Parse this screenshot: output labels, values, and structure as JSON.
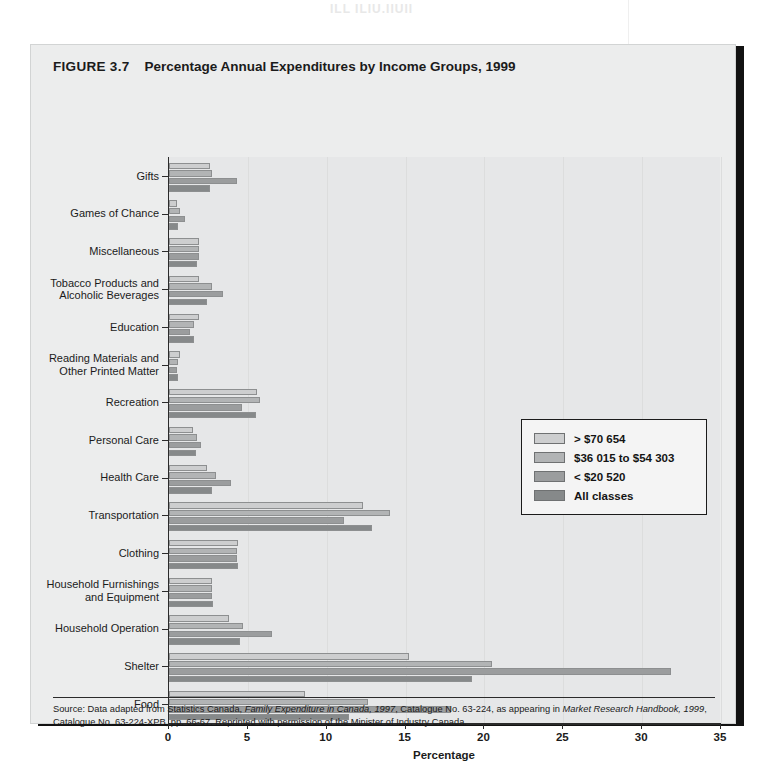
{
  "figure": {
    "label": "FIGURE 3.7",
    "title": "Percentage Annual Expenditures by Income Groups, 1999"
  },
  "page_artifacts": {
    "top_bleed": "ILL ILIU.IIUII",
    "mid_bleed": "PSYCHOGRAPHIC SEGMENTATION"
  },
  "source": {
    "prefix": "Source: Data adapted from Statistics Canada, ",
    "italic_1": "Family Expenditure in Canada, 1997",
    "middle": ", Catalogue No. 63-224, as appearing in ",
    "italic_2": "Market Research Handbook, 1999",
    "suffix": ", Catalogue No. 63-224-XPB, pp. 66-67. Reprinted with permission of the Minister of Industry Canada."
  },
  "legend": {
    "position": "middle-right",
    "items": [
      {
        "label": "> $70 654",
        "color": "#cdcecf"
      },
      {
        "label": "$36 015 to $54 303",
        "color": "#b2b4b5"
      },
      {
        "label": "< $20 520",
        "color": "#9b9d9e"
      },
      {
        "label": "All classes",
        "color": "#86898a"
      }
    ]
  },
  "chart_data": {
    "type": "bar",
    "orientation": "horizontal",
    "title": "Percentage Annual Expenditures by Income Groups, 1999",
    "xlabel": "Percentage",
    "ylabel": "",
    "xlim": [
      0,
      35
    ],
    "xticks": [
      0,
      5,
      10,
      15,
      20,
      25,
      30,
      35
    ],
    "grid": true,
    "grid_axis": "x",
    "categories": [
      "Gifts",
      "Games of Chance",
      "Miscellaneous",
      "Tobacco Products and Alcoholic Beverages",
      "Education",
      "Reading Materials and Other Printed Matter",
      "Recreation",
      "Personal Care",
      "Health Care",
      "Transportation",
      "Clothing",
      "Household Furnishings and Equipment",
      "Household Operation",
      "Shelter",
      "Food"
    ],
    "category_label_lines": [
      [
        "Gifts"
      ],
      [
        "Games of Chance"
      ],
      [
        "Miscellaneous"
      ],
      [
        "Tobacco Products and",
        "Alcoholic Beverages"
      ],
      [
        "Education"
      ],
      [
        "Reading Materials and",
        "Other Printed Matter"
      ],
      [
        "Recreation"
      ],
      [
        "Personal Care"
      ],
      [
        "Health Care"
      ],
      [
        "Transportation"
      ],
      [
        "Clothing"
      ],
      [
        "Household Furnishings",
        "and Equipment"
      ],
      [
        "Household Operation"
      ],
      [
        "Shelter"
      ],
      [
        "Food"
      ]
    ],
    "series": [
      {
        "name": "> $70 654",
        "color": "#cdcecf",
        "values": [
          2.6,
          0.5,
          1.9,
          1.9,
          1.9,
          0.7,
          5.6,
          1.5,
          2.4,
          12.3,
          4.4,
          2.7,
          3.8,
          15.2,
          8.6
        ]
      },
      {
        "name": "$36 015 to $54 303",
        "color": "#b2b4b5",
        "values": [
          2.7,
          0.7,
          1.9,
          2.7,
          1.6,
          0.6,
          5.8,
          1.8,
          3.0,
          14.0,
          4.3,
          2.7,
          4.7,
          20.5,
          12.6
        ]
      },
      {
        "name": "< $20 520",
        "color": "#9b9d9e",
        "values": [
          4.3,
          1.0,
          1.9,
          3.4,
          1.3,
          0.5,
          4.6,
          2.0,
          3.9,
          11.1,
          4.3,
          2.7,
          6.5,
          31.8,
          17.9
        ]
      },
      {
        "name": "All classes",
        "color": "#86898a",
        "values": [
          2.6,
          0.6,
          1.8,
          2.4,
          1.6,
          0.6,
          5.5,
          1.7,
          2.7,
          12.9,
          4.4,
          2.8,
          4.5,
          19.2,
          11.4
        ]
      }
    ]
  }
}
